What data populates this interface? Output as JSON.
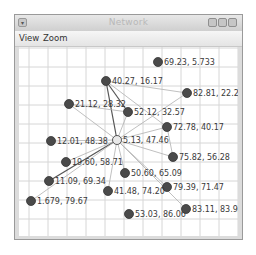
{
  "window": {
    "title": "Network",
    "controls": [
      "minimize",
      "maximize",
      "close"
    ]
  },
  "menu": {
    "items": [
      {
        "label": "View"
      },
      {
        "label": "Zoom"
      }
    ]
  },
  "graph": {
    "nodes": [
      {
        "id": 0,
        "label": "69.23, 5.733",
        "x": 157,
        "y": 61
      },
      {
        "id": 1,
        "label": "40.27, 16.17",
        "x": 105,
        "y": 80
      },
      {
        "id": 2,
        "label": "82.81, 22.24",
        "x": 186,
        "y": 92
      },
      {
        "id": 3,
        "label": "21.12, 28.32",
        "x": 68,
        "y": 103
      },
      {
        "id": 4,
        "label": "52.12, 32.57",
        "x": 127,
        "y": 111
      },
      {
        "id": 5,
        "label": "72.78, 40.17",
        "x": 166,
        "y": 126
      },
      {
        "id": 6,
        "label": "5.13, 47.46",
        "x": 116,
        "y": 139
      },
      {
        "id": 7,
        "label": "12.01, 48.38",
        "x": 50,
        "y": 140
      },
      {
        "id": 8,
        "label": "19.60, 58.71",
        "x": 65,
        "y": 161
      },
      {
        "id": 9,
        "label": "75.82, 56.28",
        "x": 172,
        "y": 156
      },
      {
        "id": 10,
        "label": "50.60, 65.09",
        "x": 124,
        "y": 172
      },
      {
        "id": 11,
        "label": "11.09, 69.34",
        "x": 48,
        "y": 180
      },
      {
        "id": 12,
        "label": "79.39, 71.47",
        "x": 166,
        "y": 186
      },
      {
        "id": 13,
        "label": "41.48, 74.20",
        "x": 107,
        "y": 190
      },
      {
        "id": 14,
        "label": "1.679, 79.67",
        "x": 30,
        "y": 200
      },
      {
        "id": 15,
        "label": "53.03, 86.06",
        "x": 128,
        "y": 213
      },
      {
        "id": 16,
        "label": "83.11, 83.93",
        "x": 185,
        "y": 208
      }
    ],
    "edges": [
      [
        1,
        6
      ],
      [
        1,
        4
      ],
      [
        1,
        2
      ],
      [
        1,
        5
      ],
      [
        3,
        6
      ],
      [
        3,
        4
      ],
      [
        6,
        4
      ],
      [
        6,
        2
      ],
      [
        6,
        5
      ],
      [
        6,
        7
      ],
      [
        6,
        9
      ],
      [
        6,
        11
      ],
      [
        6,
        13
      ],
      [
        6,
        8
      ],
      [
        6,
        12
      ],
      [
        6,
        16
      ],
      [
        6,
        10
      ],
      [
        5,
        9
      ],
      [
        6,
        14
      ]
    ]
  }
}
